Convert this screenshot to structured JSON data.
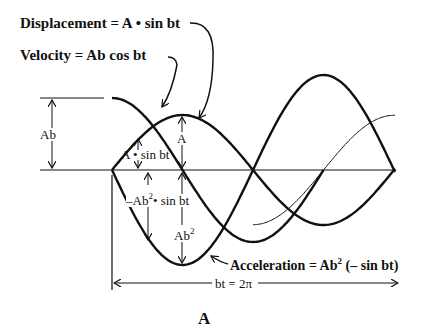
{
  "labels": {
    "displacement": "Displacement = A • sin bt",
    "velocity": "Velocity = Ab  cos bt",
    "acceleration_prefix": "Acceleration = Ab",
    "acceleration_exp": "2",
    "acceleration_suffix": " (– sin bt)",
    "ab": "Ab",
    "a_peak": "A",
    "a_sin": "A • sin bt",
    "neg_ab2_prefix": "–Ab",
    "neg_ab2_exp": "2",
    "neg_ab2_suffix": "• sin bt",
    "ab2_prefix": "Ab",
    "ab2_exp": "2",
    "period": "bt = 2π",
    "panel": "A"
  },
  "curves": {
    "origin_x": 112,
    "axis_y": 170,
    "period_px": 282,
    "displacement_amplitude_px": 55,
    "velocity_amplitude_px": 72,
    "acceleration_amplitude_px": 95,
    "stroke_color": "#111111"
  }
}
